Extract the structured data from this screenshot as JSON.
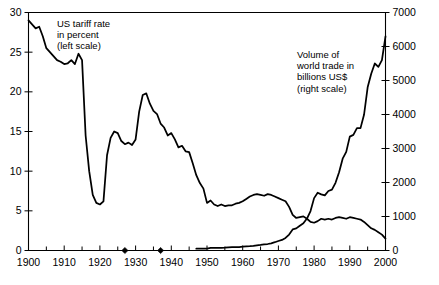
{
  "chart_data": {
    "type": "line",
    "title": "",
    "subtitle": "",
    "xlabel": "",
    "ylabel": "US tariff rate in percent",
    "y2label": "Volume of world trade in billions US$",
    "xlim": [
      1900,
      2000
    ],
    "ylim": [
      0,
      30
    ],
    "y2lim": [
      0,
      7000
    ],
    "grid": false,
    "legend_position": "inline-annotations",
    "xticks": [
      1900,
      1910,
      1920,
      1930,
      1940,
      1950,
      1960,
      1970,
      1980,
      1990,
      2000
    ],
    "xtick_labels": [
      "1900",
      "1910",
      "1920",
      "1930",
      "1940",
      "1950",
      "1960",
      "1970",
      "1980",
      "1990",
      "2000"
    ],
    "xminor_ticks": [
      1905,
      1915,
      1925,
      1935,
      1945,
      1955,
      1965,
      1975,
      1985,
      1995
    ],
    "yticks": [
      0,
      5,
      10,
      15,
      20,
      25,
      30
    ],
    "ytick_labels": [
      "0",
      "5",
      "10",
      "15",
      "20",
      "25",
      "30"
    ],
    "y2ticks": [
      0,
      1000,
      2000,
      3000,
      4000,
      5000,
      6000,
      7000
    ],
    "y2tick_labels": [
      "0",
      "1000",
      "2000",
      "3000",
      "4000",
      "5000",
      "6000",
      "7000"
    ],
    "annotations": [
      {
        "name": "tariff-annotation",
        "text": "US tariff rate\nin percent\n(left scale)",
        "x": 1913,
        "y": 28
      },
      {
        "name": "trade-annotation",
        "text": "Volume of\nworld trade in\nbillions US$\n(right scale)",
        "x": 1968,
        "y": 24
      }
    ],
    "axis_markers": [
      {
        "name": "diamond-marker-1927",
        "x": 1927,
        "y": 0
      },
      {
        "name": "diamond-marker-1937",
        "x": 1937,
        "y": 0
      }
    ],
    "series": [
      {
        "name": "US tariff rate",
        "axis": "left",
        "units": "percent",
        "color": "#000000",
        "x": [
          1900,
          1901,
          1902,
          1903,
          1904,
          1905,
          1906,
          1907,
          1908,
          1909,
          1910,
          1911,
          1912,
          1913,
          1914,
          1915,
          1916,
          1917,
          1918,
          1919,
          1920,
          1921,
          1922,
          1923,
          1924,
          1925,
          1926,
          1927,
          1928,
          1929,
          1930,
          1931,
          1932,
          1933,
          1934,
          1935,
          1936,
          1937,
          1938,
          1939,
          1940,
          1941,
          1942,
          1943,
          1944,
          1945,
          1946,
          1947,
          1948,
          1949,
          1950,
          1951,
          1952,
          1953,
          1954,
          1955,
          1956,
          1957,
          1958,
          1959,
          1960,
          1961,
          1962,
          1963,
          1964,
          1965,
          1966,
          1967,
          1968,
          1969,
          1970,
          1971,
          1972,
          1973,
          1974,
          1975,
          1976,
          1977,
          1978,
          1979,
          1980,
          1981,
          1982,
          1983,
          1984,
          1985,
          1986,
          1987,
          1988,
          1989,
          1990,
          1991,
          1992,
          1993,
          1994,
          1995,
          1996,
          1997,
          1998,
          1999,
          2000
        ],
        "values": [
          29.0,
          28.5,
          28.0,
          28.2,
          27.0,
          25.5,
          25.0,
          24.5,
          24.0,
          23.8,
          23.5,
          23.6,
          24.0,
          23.5,
          24.8,
          24.0,
          14.5,
          10.0,
          7.0,
          6.0,
          5.8,
          6.2,
          12.0,
          14.2,
          15.0,
          14.8,
          13.8,
          13.4,
          13.6,
          13.3,
          14.0,
          17.5,
          19.6,
          19.8,
          18.5,
          17.6,
          17.2,
          16.0,
          15.5,
          14.5,
          14.8,
          14.0,
          13.0,
          13.2,
          12.5,
          12.4,
          11.0,
          9.5,
          8.5,
          7.8,
          6.0,
          6.3,
          5.8,
          5.6,
          5.8,
          5.6,
          5.7,
          5.7,
          5.9,
          6.0,
          6.2,
          6.5,
          6.8,
          7.0,
          7.1,
          7.0,
          6.9,
          7.1,
          7.0,
          6.8,
          6.6,
          6.4,
          6.2,
          5.5,
          4.5,
          4.1,
          4.2,
          4.3,
          4.0,
          3.6,
          3.5,
          3.7,
          4.0,
          3.9,
          4.0,
          3.9,
          4.1,
          4.2,
          4.1,
          4.0,
          4.2,
          4.1,
          4.0,
          3.9,
          3.6,
          3.2,
          2.8,
          2.6,
          2.3,
          2.0,
          1.5
        ]
      },
      {
        "name": "Volume of world trade",
        "axis": "right",
        "units": "billions US$",
        "color": "#000000",
        "x": [
          1947,
          1948,
          1949,
          1950,
          1951,
          1952,
          1953,
          1954,
          1955,
          1956,
          1957,
          1958,
          1959,
          1960,
          1961,
          1962,
          1963,
          1964,
          1965,
          1966,
          1967,
          1968,
          1969,
          1970,
          1971,
          1972,
          1973,
          1974,
          1975,
          1976,
          1977,
          1978,
          1979,
          1980,
          1981,
          1982,
          1983,
          1984,
          1985,
          1986,
          1987,
          1988,
          1989,
          1990,
          1991,
          1992,
          1993,
          1994,
          1995,
          1996,
          1997,
          1998,
          1999,
          2000
        ],
        "values": [
          54,
          56,
          54,
          58,
          77,
          75,
          74,
          77,
          84,
          94,
          101,
          96,
          102,
          113,
          119,
          126,
          137,
          153,
          165,
          181,
          191,
          212,
          244,
          280,
          312,
          370,
          470,
          620,
          650,
          730,
          800,
          940,
          1160,
          1540,
          1700,
          1650,
          1620,
          1750,
          1790,
          1990,
          2300,
          2700,
          2900,
          3350,
          3400,
          3600,
          3600,
          4000,
          4800,
          5200,
          5500,
          5400,
          5600,
          6300
        ]
      }
    ]
  }
}
